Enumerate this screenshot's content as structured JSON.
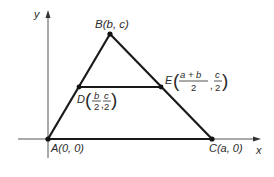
{
  "diagram": {
    "axes": {
      "x_label": "x",
      "y_label": "y"
    },
    "points": {
      "A": {
        "name": "A",
        "coords": "(0, 0)"
      },
      "B": {
        "name": "B",
        "coords": "(b, c)"
      },
      "C": {
        "name": "C",
        "coords": "(a, 0)"
      },
      "D": {
        "name": "D",
        "x_num": "b",
        "x_den": "2",
        "y_num": "c",
        "y_den": "2"
      },
      "E": {
        "name": "E",
        "x_num": "a + b",
        "x_den": "2",
        "y_num": "c",
        "y_den": "2"
      }
    },
    "segments": [
      "AB",
      "BC",
      "AC",
      "DE"
    ],
    "colors": {
      "stroke": "#1a1a1a",
      "axis": "#555555"
    }
  }
}
